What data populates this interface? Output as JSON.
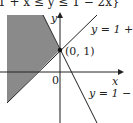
{
  "header_text": "{(x, y) | 1 + x ≤ y ≤ 1 − 2x}",
  "header_visible": "1 + x ≤ y ≤ 1 − 2x}",
  "axes": {
    "x_label": "x",
    "y_label": "y",
    "origin_label": "0"
  },
  "point": {
    "label": "(0, 1)"
  },
  "lines": [
    {
      "label": "y = 1 + x"
    },
    {
      "label": "y = 1 − 2x"
    }
  ],
  "colors": {
    "shade": "#8a8a8a",
    "line": "#222222"
  }
}
